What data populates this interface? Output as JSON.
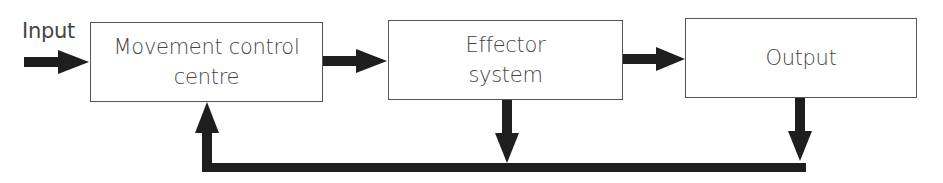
{
  "diagram": {
    "type": "block-diagram-feedback-loop",
    "input_label": "Input",
    "blocks": [
      {
        "id": "movement-control-centre",
        "line1": "Movement control",
        "line2": "centre"
      },
      {
        "id": "effector-system",
        "line1": "Effector",
        "line2": "system"
      },
      {
        "id": "output",
        "line1": "Output",
        "line2": ""
      }
    ],
    "connections": [
      {
        "from": "input",
        "to": "movement-control-centre"
      },
      {
        "from": "movement-control-centre",
        "to": "effector-system"
      },
      {
        "from": "effector-system",
        "to": "output"
      },
      {
        "from": "effector-system",
        "to": "feedback-line"
      },
      {
        "from": "output",
        "to": "feedback-line"
      },
      {
        "from": "feedback-line",
        "to": "movement-control-centre"
      }
    ],
    "colors": {
      "arrow": "#1e1e1e",
      "border": "#555555",
      "text": "#444444",
      "background": "#ffffff"
    }
  }
}
